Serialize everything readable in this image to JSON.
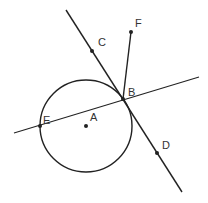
{
  "diagram": {
    "type": "geometry",
    "circle": {
      "center": "A",
      "cx": 86,
      "cy": 126,
      "r": 46
    },
    "points": [
      {
        "name": "A",
        "x": 86,
        "y": 126,
        "label_dx": 4,
        "label_dy": -5
      },
      {
        "name": "B",
        "x": 123,
        "y": 99,
        "label_dx": 5,
        "label_dy": -3
      },
      {
        "name": "C",
        "x": 92,
        "y": 51,
        "label_dx": 6,
        "label_dy": -5
      },
      {
        "name": "D",
        "x": 157,
        "y": 153,
        "label_dx": 5,
        "label_dy": -4
      },
      {
        "name": "E",
        "x": 40,
        "y": 126,
        "label_dx": 3,
        "label_dy": -2
      },
      {
        "name": "F",
        "x": 131,
        "y": 32,
        "label_dx": 4,
        "label_dy": -5
      }
    ],
    "lines": [
      {
        "name": "tangent-line-CD",
        "x1": 66,
        "y1": 10,
        "x2": 182,
        "y2": 192
      },
      {
        "name": "secant-line-EB",
        "x1": 14,
        "y1": 133,
        "x2": 199,
        "y2": 77
      },
      {
        "name": "segment-BF",
        "x1": 123,
        "y1": 99,
        "x2": 131,
        "y2": 32
      }
    ],
    "colors": {
      "stroke": "#222222",
      "background": "#ffffff"
    }
  }
}
